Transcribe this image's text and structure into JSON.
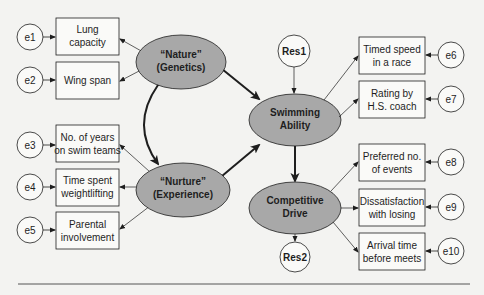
{
  "diagram": {
    "type": "structural-equation-model",
    "latent": {
      "nature": {
        "line1": "“Nature”",
        "line2": "(Genetics)"
      },
      "nurture": {
        "line1": "“Nurture”",
        "line2": "(Experience)"
      },
      "swimming": {
        "line1": "Swimming",
        "line2": "Ability"
      },
      "competitive": {
        "line1": "Competitive",
        "line2": "Drive"
      }
    },
    "residuals": {
      "res1": "Res1",
      "res2": "Res2"
    },
    "indicators_left": [
      {
        "line1": "Lung",
        "line2": "capacity",
        "error": "e1"
      },
      {
        "line1": "Wing span",
        "line2": "",
        "error": "e2"
      },
      {
        "line1": "No. of years",
        "line2": "on swim teams",
        "error": "e3"
      },
      {
        "line1": "Time spent",
        "line2": "weightlifting",
        "error": "e4"
      },
      {
        "line1": "Parental",
        "line2": "involvement",
        "error": "e5"
      }
    ],
    "indicators_right": [
      {
        "line1": "Timed speed",
        "line2": "in a race",
        "error": "e6"
      },
      {
        "line1": "Rating by",
        "line2": "H.S. coach",
        "error": "e7"
      },
      {
        "line1": "Preferred no.",
        "line2": "of events",
        "error": "e8"
      },
      {
        "line1": "Dissatisfaction",
        "line2": "with losing",
        "error": "e9"
      },
      {
        "line1": "Arrival time",
        "line2": "before meets",
        "error": "e10"
      }
    ],
    "colors": {
      "latent_fill": "#a8a8a8",
      "background": "#f3f3f1",
      "stroke": "#1e1e1e"
    }
  }
}
